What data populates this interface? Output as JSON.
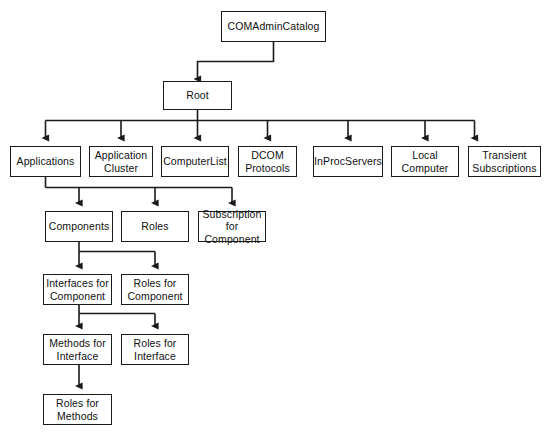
{
  "diagram": {
    "type": "tree-diagram",
    "background_color": "#ffffff",
    "box_border_color": "#1a1a1a",
    "connector_color": "#1a1a1a",
    "text_color": "#111111",
    "nodes": [
      {
        "id": "comadmincatalog",
        "label": "COMAdminCatalog",
        "x": 221,
        "y": 11,
        "w": 105,
        "h": 31
      },
      {
        "id": "root",
        "label": "Root",
        "x": 163,
        "y": 81,
        "w": 69,
        "h": 29
      },
      {
        "id": "applications",
        "label": "Applications",
        "x": 10,
        "y": 146,
        "w": 71,
        "h": 31
      },
      {
        "id": "application-cluster",
        "label": "Application\nCluster",
        "x": 89,
        "y": 146,
        "w": 64,
        "h": 31
      },
      {
        "id": "computerlist",
        "label": "ComputerList",
        "x": 161,
        "y": 146,
        "w": 68,
        "h": 31
      },
      {
        "id": "dcom-protocols",
        "label": "DCOM\nProtocols",
        "x": 238,
        "y": 146,
        "w": 59,
        "h": 31
      },
      {
        "id": "inprocservers",
        "label": "InProcServers",
        "x": 313,
        "y": 146,
        "w": 70,
        "h": 31
      },
      {
        "id": "local-computer",
        "label": "Local\nComputer",
        "x": 391,
        "y": 146,
        "w": 68,
        "h": 31
      },
      {
        "id": "transient-subscriptions",
        "label": "Transient\nSubscriptions",
        "x": 468,
        "y": 146,
        "w": 73,
        "h": 31
      },
      {
        "id": "components",
        "label": "Components",
        "x": 45,
        "y": 211,
        "w": 68,
        "h": 31
      },
      {
        "id": "roles",
        "label": "Roles",
        "x": 121,
        "y": 211,
        "w": 68,
        "h": 31
      },
      {
        "id": "subscription-component",
        "label": "Subscription\nfor Component",
        "x": 198,
        "y": 211,
        "w": 68,
        "h": 31
      },
      {
        "id": "interfaces-component",
        "label": "Interfaces for\nComponent",
        "x": 43,
        "y": 274,
        "w": 69,
        "h": 31
      },
      {
        "id": "roles-component",
        "label": "Roles for\nComponent",
        "x": 121,
        "y": 274,
        "w": 68,
        "h": 31
      },
      {
        "id": "methods-interface",
        "label": "Methods for\nInterface",
        "x": 43,
        "y": 334,
        "w": 69,
        "h": 31
      },
      {
        "id": "roles-interface",
        "label": "Roles for\nInterface",
        "x": 121,
        "y": 334,
        "w": 68,
        "h": 31
      },
      {
        "id": "roles-methods",
        "label": "Roles for\nMethods",
        "x": 43,
        "y": 394,
        "w": 69,
        "h": 31
      }
    ],
    "edges": [
      {
        "id": "edge-catalog-to-root",
        "from": "comadmincatalog",
        "to": "root"
      },
      {
        "id": "edge-root-to-applications",
        "from": "root",
        "to": "applications"
      },
      {
        "id": "edge-root-to-application-cluster",
        "from": "root",
        "to": "application-cluster"
      },
      {
        "id": "edge-root-to-computerlist",
        "from": "root",
        "to": "computerlist"
      },
      {
        "id": "edge-root-to-dcom-protocols",
        "from": "root",
        "to": "dcom-protocols"
      },
      {
        "id": "edge-root-to-inprocservers",
        "from": "root",
        "to": "inprocservers"
      },
      {
        "id": "edge-root-to-local-computer",
        "from": "root",
        "to": "local-computer"
      },
      {
        "id": "edge-root-to-transient-subscriptions",
        "from": "root",
        "to": "transient-subscriptions"
      },
      {
        "id": "edge-applications-to-components",
        "from": "applications",
        "to": "components"
      },
      {
        "id": "edge-applications-to-roles",
        "from": "applications",
        "to": "roles"
      },
      {
        "id": "edge-applications-to-subscription",
        "from": "applications",
        "to": "subscription-component"
      },
      {
        "id": "edge-components-to-interfaces",
        "from": "components",
        "to": "interfaces-component"
      },
      {
        "id": "edge-components-to-roles-component",
        "from": "components",
        "to": "roles-component"
      },
      {
        "id": "edge-interfaces-to-methods",
        "from": "interfaces-component",
        "to": "methods-interface"
      },
      {
        "id": "edge-interfaces-to-roles-interface",
        "from": "interfaces-component",
        "to": "roles-interface"
      },
      {
        "id": "edge-methods-to-roles-methods",
        "from": "methods-interface",
        "to": "roles-methods"
      }
    ]
  }
}
